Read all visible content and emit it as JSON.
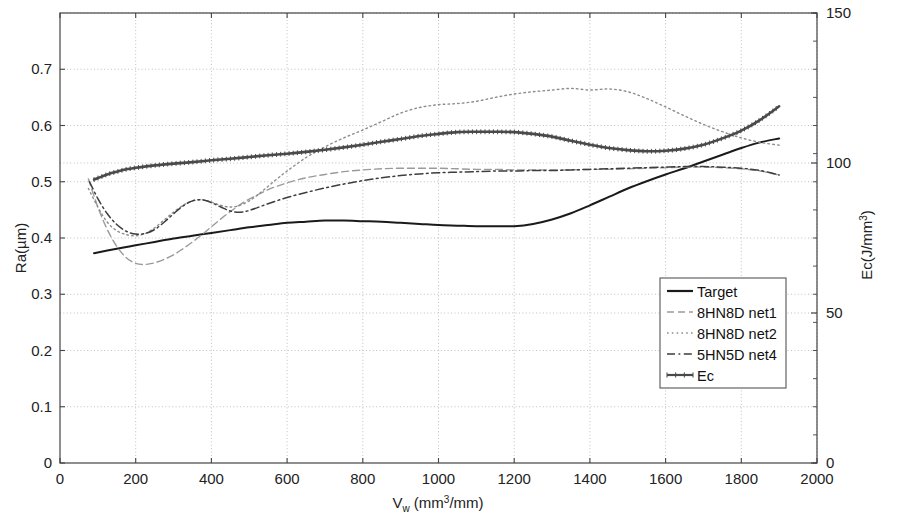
{
  "chart_data": {
    "type": "line",
    "title": "",
    "xlabel": "V_w (mm3/mm)",
    "xlabel_base": "V",
    "xlabel_sub": "w",
    "xlabel_rest_a": " (mm",
    "xlabel_sup": "3",
    "xlabel_rest_b": "/mm)",
    "ylabel": "Ra(µm)",
    "ylabel_right_base": "Ec(J/mm",
    "ylabel_right_sup": "3",
    "ylabel_right_close": ")",
    "xlim": [
      0,
      2000
    ],
    "ylim": [
      0,
      0.8
    ],
    "ylim_right": [
      0,
      150
    ],
    "xticks": [
      0,
      200,
      400,
      600,
      800,
      1000,
      1200,
      1400,
      1600,
      1800,
      2000
    ],
    "xticklabels": [
      "0",
      "200",
      "400",
      "600",
      "800",
      "1000",
      "1200",
      "1400",
      "1600",
      "1800",
      "2000"
    ],
    "yticks": [
      0,
      0.1,
      0.2,
      0.3,
      0.4,
      0.5,
      0.6,
      0.7
    ],
    "yticklabels": [
      "0",
      "0.1",
      "0.2",
      "0.3",
      "0.4",
      "0.5",
      "0.6",
      "0.7"
    ],
    "yticks_right": [
      0,
      50,
      100,
      150
    ],
    "yticklabels_right": [
      "0",
      "50",
      "100",
      "150"
    ],
    "grid": true,
    "grid_style": "dotted",
    "legend_position": "lower-right",
    "series": [
      {
        "name": "Target",
        "style": "solid",
        "color": "#1a1a1a",
        "width": 2.0,
        "axis": "left",
        "x": [
          90,
          150,
          200,
          250,
          300,
          350,
          400,
          450,
          500,
          550,
          600,
          650,
          700,
          750,
          800,
          850,
          900,
          950,
          1000,
          1050,
          1100,
          1150,
          1200,
          1250,
          1300,
          1350,
          1400,
          1450,
          1500,
          1550,
          1600,
          1650,
          1700,
          1750,
          1800,
          1850,
          1900
        ],
        "y": [
          0.373,
          0.381,
          0.387,
          0.393,
          0.399,
          0.404,
          0.409,
          0.414,
          0.419,
          0.423,
          0.427,
          0.429,
          0.431,
          0.431,
          0.43,
          0.429,
          0.427,
          0.425,
          0.423,
          0.422,
          0.421,
          0.421,
          0.421,
          0.425,
          0.433,
          0.444,
          0.458,
          0.473,
          0.488,
          0.501,
          0.513,
          0.524,
          0.536,
          0.548,
          0.56,
          0.57,
          0.577
        ]
      },
      {
        "name": "8HN8D net1",
        "style": "dashed",
        "color": "#9a9a9a",
        "width": 1.4,
        "axis": "left",
        "x": [
          75,
          100,
          125,
          150,
          175,
          200,
          225,
          250,
          275,
          300,
          325,
          350,
          375,
          400,
          425,
          450,
          475,
          500,
          550,
          600,
          650,
          700,
          750,
          800,
          850,
          900,
          950,
          1000,
          1050,
          1100,
          1150,
          1200,
          1250,
          1300,
          1350,
          1400,
          1450,
          1500,
          1550,
          1600,
          1650,
          1700,
          1750,
          1800,
          1850,
          1900
        ],
        "y": [
          0.505,
          0.455,
          0.415,
          0.385,
          0.365,
          0.355,
          0.353,
          0.356,
          0.362,
          0.37,
          0.381,
          0.393,
          0.406,
          0.42,
          0.434,
          0.447,
          0.459,
          0.469,
          0.486,
          0.498,
          0.507,
          0.513,
          0.518,
          0.521,
          0.523,
          0.524,
          0.524,
          0.524,
          0.523,
          0.522,
          0.522,
          0.521,
          0.521,
          0.521,
          0.521,
          0.522,
          0.522,
          0.523,
          0.524,
          0.525,
          0.526,
          0.526,
          0.525,
          0.523,
          0.519,
          0.512
        ]
      },
      {
        "name": "8HN8D net2",
        "style": "dotted",
        "color": "#8d8d8d",
        "width": 1.4,
        "axis": "left",
        "x": [
          75,
          100,
          125,
          150,
          175,
          200,
          225,
          250,
          275,
          300,
          325,
          350,
          375,
          400,
          425,
          450,
          475,
          500,
          525,
          550,
          575,
          600,
          650,
          700,
          750,
          800,
          850,
          900,
          950,
          1000,
          1050,
          1100,
          1150,
          1200,
          1250,
          1300,
          1350,
          1400,
          1450,
          1500,
          1550,
          1600,
          1650,
          1700,
          1750,
          1800,
          1850,
          1900
        ],
        "y": [
          0.488,
          0.455,
          0.428,
          0.413,
          0.406,
          0.404,
          0.408,
          0.418,
          0.432,
          0.446,
          0.458,
          0.466,
          0.468,
          0.464,
          0.458,
          0.455,
          0.458,
          0.466,
          0.478,
          0.492,
          0.506,
          0.519,
          0.543,
          0.562,
          0.578,
          0.592,
          0.607,
          0.622,
          0.632,
          0.637,
          0.639,
          0.643,
          0.65,
          0.656,
          0.66,
          0.663,
          0.666,
          0.663,
          0.665,
          0.66,
          0.648,
          0.633,
          0.617,
          0.602,
          0.589,
          0.578,
          0.57,
          0.565
        ]
      },
      {
        "name": "5HN5D net4",
        "style": "dashdot",
        "color": "#3d3d3d",
        "width": 1.5,
        "axis": "left",
        "x": [
          78,
          100,
          125,
          150,
          175,
          200,
          225,
          250,
          275,
          300,
          325,
          350,
          375,
          400,
          425,
          450,
          475,
          500,
          550,
          600,
          650,
          700,
          750,
          800,
          850,
          900,
          950,
          1000,
          1050,
          1100,
          1150,
          1200,
          1250,
          1300,
          1350,
          1400,
          1450,
          1500,
          1550,
          1600,
          1650,
          1700,
          1750,
          1800,
          1850,
          1900
        ],
        "y": [
          0.5,
          0.47,
          0.443,
          0.424,
          0.412,
          0.407,
          0.408,
          0.415,
          0.428,
          0.443,
          0.457,
          0.466,
          0.468,
          0.463,
          0.455,
          0.448,
          0.446,
          0.449,
          0.461,
          0.472,
          0.481,
          0.489,
          0.496,
          0.502,
          0.507,
          0.511,
          0.514,
          0.516,
          0.517,
          0.518,
          0.519,
          0.519,
          0.52,
          0.52,
          0.521,
          0.522,
          0.523,
          0.524,
          0.525,
          0.526,
          0.527,
          0.527,
          0.526,
          0.524,
          0.52,
          0.512
        ]
      },
      {
        "name": "Ec",
        "style": "solid-marker",
        "color": "#4a4a4a",
        "width": 2.6,
        "axis": "right",
        "x": [
          90,
          125,
          150,
          175,
          200,
          250,
          300,
          350,
          400,
          450,
          500,
          550,
          600,
          650,
          700,
          750,
          800,
          850,
          900,
          950,
          1000,
          1050,
          1100,
          1150,
          1200,
          1250,
          1300,
          1350,
          1400,
          1450,
          1500,
          1550,
          1600,
          1650,
          1700,
          1750,
          1800,
          1850,
          1900
        ],
        "y_left_equivalent": [
          0.504,
          0.513,
          0.518,
          0.522,
          0.525,
          0.529,
          0.532,
          0.535,
          0.538,
          0.541,
          0.544,
          0.547,
          0.55,
          0.553,
          0.557,
          0.561,
          0.566,
          0.571,
          0.576,
          0.581,
          0.585,
          0.588,
          0.589,
          0.589,
          0.588,
          0.585,
          0.58,
          0.573,
          0.566,
          0.56,
          0.556,
          0.554,
          0.555,
          0.559,
          0.566,
          0.577,
          0.591,
          0.61,
          0.634
        ],
        "y": [
          94.5,
          96.2,
          97.1,
          97.9,
          98.4,
          99.2,
          99.8,
          100.3,
          100.9,
          101.4,
          102.0,
          102.6,
          103.1,
          103.7,
          104.4,
          105.2,
          106.1,
          107.1,
          108.0,
          109.0,
          109.7,
          110.3,
          110.4,
          110.4,
          110.3,
          109.7,
          108.8,
          107.4,
          106.1,
          105.0,
          104.3,
          103.9,
          104.1,
          104.8,
          106.1,
          108.2,
          110.8,
          114.4,
          118.9
        ]
      }
    ],
    "legend": [
      {
        "label": "Target",
        "style": "solid",
        "color": "#1a1a1a"
      },
      {
        "label": "8HN8D net1",
        "style": "dashed",
        "color": "#9a9a9a"
      },
      {
        "label": "8HN8D net2",
        "style": "dotted",
        "color": "#8d8d8d"
      },
      {
        "label": "5HN5D net4",
        "style": "dashdot",
        "color": "#3d3d3d"
      },
      {
        "label": "Ec",
        "style": "solid-marker",
        "color": "#4a4a4a"
      }
    ]
  },
  "colors": {
    "background": "#ffffff",
    "axis": "#444444",
    "grid": "#b9b9b9",
    "text": "#1a1a1a"
  }
}
